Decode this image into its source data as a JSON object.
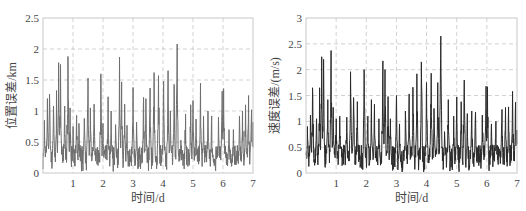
{
  "chart_data": [
    {
      "type": "line",
      "title": "",
      "xlabel": "时间/d",
      "ylabel": "位置误差/km",
      "xlim": [
        0,
        7
      ],
      "ylim": [
        0,
        2.5
      ],
      "xticks": [
        1,
        2,
        3,
        4,
        5,
        6,
        7
      ],
      "xtick_labels": [
        "1",
        "2",
        "3",
        "4",
        "5",
        "6",
        "7"
      ],
      "yticks": [
        0,
        0.5,
        1,
        1.5,
        2,
        2.5
      ],
      "ytick_labels": [
        "0",
        "0.5",
        "1",
        "1.5",
        "2",
        "2.5"
      ],
      "grid": true,
      "grid_style": "dashed",
      "line_color": "#6e6e6e",
      "baseline_range": [
        0.1,
        0.45
      ],
      "series": [
        {
          "name": "位置误差",
          "peaks": [
            {
              "x": 0.05,
              "y": 0.85
            },
            {
              "x": 0.15,
              "y": 1.2
            },
            {
              "x": 0.22,
              "y": 1.27
            },
            {
              "x": 0.35,
              "y": 1.08
            },
            {
              "x": 0.45,
              "y": 1.33
            },
            {
              "x": 0.52,
              "y": 1.78
            },
            {
              "x": 0.58,
              "y": 1.75
            },
            {
              "x": 0.72,
              "y": 1.08
            },
            {
              "x": 0.83,
              "y": 1.88
            },
            {
              "x": 0.9,
              "y": 1.05
            },
            {
              "x": 1.0,
              "y": 0.75
            },
            {
              "x": 1.12,
              "y": 0.93
            },
            {
              "x": 1.2,
              "y": 0.8
            },
            {
              "x": 1.38,
              "y": 0.88
            },
            {
              "x": 1.5,
              "y": 1.53
            },
            {
              "x": 1.58,
              "y": 1.05
            },
            {
              "x": 1.7,
              "y": 1.11
            },
            {
              "x": 1.93,
              "y": 1.6
            },
            {
              "x": 2.0,
              "y": 0.8
            },
            {
              "x": 2.17,
              "y": 1.23
            },
            {
              "x": 2.27,
              "y": 1.0
            },
            {
              "x": 2.42,
              "y": 0.78
            },
            {
              "x": 2.55,
              "y": 1.87
            },
            {
              "x": 2.62,
              "y": 1.47
            },
            {
              "x": 2.72,
              "y": 1.11
            },
            {
              "x": 2.8,
              "y": 0.77
            },
            {
              "x": 3.0,
              "y": 1.38
            },
            {
              "x": 3.12,
              "y": 0.82
            },
            {
              "x": 3.35,
              "y": 1.22
            },
            {
              "x": 3.43,
              "y": 1.2
            },
            {
              "x": 3.57,
              "y": 1.37
            },
            {
              "x": 3.7,
              "y": 1.62
            },
            {
              "x": 3.85,
              "y": 1.57
            },
            {
              "x": 4.02,
              "y": 1.48
            },
            {
              "x": 4.17,
              "y": 1.65
            },
            {
              "x": 4.25,
              "y": 1.0
            },
            {
              "x": 4.37,
              "y": 1.43
            },
            {
              "x": 4.47,
              "y": 2.08
            },
            {
              "x": 4.6,
              "y": 0.53
            },
            {
              "x": 4.75,
              "y": 0.95
            },
            {
              "x": 4.92,
              "y": 1.1
            },
            {
              "x": 5.0,
              "y": 1.17
            },
            {
              "x": 5.1,
              "y": 0.87
            },
            {
              "x": 5.25,
              "y": 1.45
            },
            {
              "x": 5.35,
              "y": 0.92
            },
            {
              "x": 5.5,
              "y": 1.0
            },
            {
              "x": 5.62,
              "y": 0.92
            },
            {
              "x": 5.85,
              "y": 0.9
            },
            {
              "x": 5.97,
              "y": 1.32
            },
            {
              "x": 6.02,
              "y": 1.36
            },
            {
              "x": 6.2,
              "y": 0.7
            },
            {
              "x": 6.35,
              "y": 0.7
            },
            {
              "x": 6.55,
              "y": 0.92
            },
            {
              "x": 6.65,
              "y": 1.0
            },
            {
              "x": 6.75,
              "y": 1.1
            },
            {
              "x": 6.85,
              "y": 1.25
            },
            {
              "x": 6.95,
              "y": 1.02
            },
            {
              "x": 6.99,
              "y": 0.82
            }
          ]
        }
      ]
    },
    {
      "type": "line",
      "title": "",
      "xlabel": "时间/d",
      "ylabel": "速度误差/(m/s)",
      "xlim": [
        0,
        7
      ],
      "ylim": [
        0,
        3
      ],
      "xticks": [
        1,
        2,
        3,
        4,
        5,
        6,
        7
      ],
      "xtick_labels": [
        "1",
        "2",
        "3",
        "4",
        "5",
        "6",
        "7"
      ],
      "yticks": [
        0,
        0.5,
        1,
        1.5,
        2,
        2.5,
        3
      ],
      "ytick_labels": [
        "0",
        "0.5",
        "1",
        "1.5",
        "2",
        "2.5",
        "3"
      ],
      "grid": true,
      "grid_style": "dashed",
      "line_color": "#2a2a2a",
      "baseline_range": [
        0.1,
        0.55
      ],
      "series": [
        {
          "name": "速度误差",
          "peaks": [
            {
              "x": 0.05,
              "y": 0.9
            },
            {
              "x": 0.15,
              "y": 1.12
            },
            {
              "x": 0.22,
              "y": 1.65
            },
            {
              "x": 0.35,
              "y": 1.05
            },
            {
              "x": 0.45,
              "y": 1.65
            },
            {
              "x": 0.52,
              "y": 2.25
            },
            {
              "x": 0.58,
              "y": 2.2
            },
            {
              "x": 0.72,
              "y": 1.42
            },
            {
              "x": 0.83,
              "y": 2.37
            },
            {
              "x": 0.9,
              "y": 1.27
            },
            {
              "x": 1.0,
              "y": 1.05
            },
            {
              "x": 1.12,
              "y": 1.1
            },
            {
              "x": 1.35,
              "y": 1.08
            },
            {
              "x": 1.48,
              "y": 1.96
            },
            {
              "x": 1.58,
              "y": 1.46
            },
            {
              "x": 1.7,
              "y": 1.38
            },
            {
              "x": 1.93,
              "y": 2.0
            },
            {
              "x": 2.05,
              "y": 1.1
            },
            {
              "x": 2.17,
              "y": 1.42
            },
            {
              "x": 2.27,
              "y": 1.33
            },
            {
              "x": 2.42,
              "y": 1.05
            },
            {
              "x": 2.55,
              "y": 2.17
            },
            {
              "x": 2.62,
              "y": 2.0
            },
            {
              "x": 2.72,
              "y": 1.48
            },
            {
              "x": 2.8,
              "y": 1.05
            },
            {
              "x": 3.0,
              "y": 1.5
            },
            {
              "x": 3.1,
              "y": 0.95
            },
            {
              "x": 3.3,
              "y": 1.2
            },
            {
              "x": 3.42,
              "y": 1.53
            },
            {
              "x": 3.55,
              "y": 1.66
            },
            {
              "x": 3.68,
              "y": 1.92
            },
            {
              "x": 3.83,
              "y": 2.15
            },
            {
              "x": 4.0,
              "y": 1.75
            },
            {
              "x": 4.15,
              "y": 1.93
            },
            {
              "x": 4.25,
              "y": 1.25
            },
            {
              "x": 4.37,
              "y": 1.75
            },
            {
              "x": 4.47,
              "y": 2.65
            },
            {
              "x": 4.6,
              "y": 0.8
            },
            {
              "x": 4.72,
              "y": 1.42
            },
            {
              "x": 4.9,
              "y": 1.1
            },
            {
              "x": 5.0,
              "y": 1.47
            },
            {
              "x": 5.15,
              "y": 1.38
            },
            {
              "x": 5.25,
              "y": 1.8
            },
            {
              "x": 5.35,
              "y": 1.15
            },
            {
              "x": 5.5,
              "y": 1.2
            },
            {
              "x": 5.62,
              "y": 1.18
            },
            {
              "x": 5.85,
              "y": 1.12
            },
            {
              "x": 5.97,
              "y": 1.68
            },
            {
              "x": 6.02,
              "y": 1.67
            },
            {
              "x": 6.15,
              "y": 0.95
            },
            {
              "x": 6.3,
              "y": 1.0
            },
            {
              "x": 6.5,
              "y": 1.23
            },
            {
              "x": 6.62,
              "y": 1.27
            },
            {
              "x": 6.72,
              "y": 1.28
            },
            {
              "x": 6.85,
              "y": 1.58
            },
            {
              "x": 6.95,
              "y": 1.37
            },
            {
              "x": 6.99,
              "y": 0.83
            }
          ]
        }
      ]
    }
  ],
  "charts": [
    {
      "ylabel": "位置误差/km",
      "xlabel": "时间/d"
    },
    {
      "ylabel": "速度误差/(m/s)",
      "xlabel": "时间/d"
    }
  ],
  "colors": {
    "frame": "#c8c8c8",
    "grid": "#bdbdbd",
    "tick_text": "#444444",
    "left_series": "#6e6e6e",
    "right_series": "#2a2a2a"
  }
}
